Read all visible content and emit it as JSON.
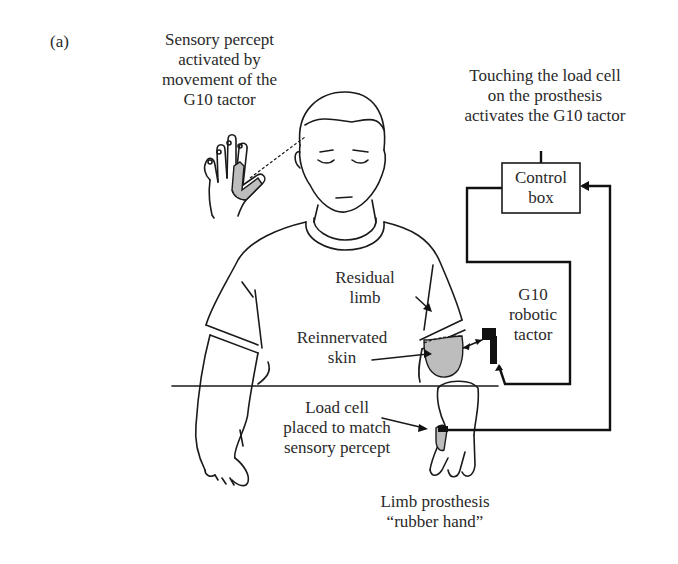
{
  "figure": {
    "panel_label": "(a)",
    "labels": {
      "sensory_percept": [
        "Sensory percept",
        "activated by",
        "movement of the",
        "G10 tactor"
      ],
      "touching_load_cell": [
        "Touching the load cell",
        "on the prosthesis",
        "activates the G10 tactor"
      ],
      "control_box": [
        "Control",
        "box"
      ],
      "residual_limb": [
        "Residual",
        "limb"
      ],
      "reinnervated_skin": [
        "Reinnervated",
        "skin"
      ],
      "g10_robotic_tactor": [
        "G10",
        "robotic",
        "tactor"
      ],
      "load_cell": [
        "Load cell",
        "placed to match",
        "sensory percept"
      ],
      "limb_prosthesis": [
        "Limb prosthesis",
        "“rubber hand”"
      ]
    },
    "colors": {
      "ink": "#1a1a1a",
      "shading": "#bdbdbd",
      "background": "#ffffff"
    }
  }
}
